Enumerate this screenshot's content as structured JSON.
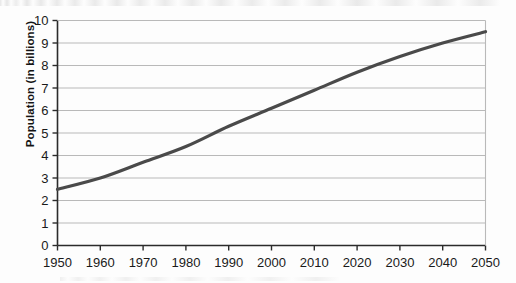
{
  "chart_data": {
    "type": "line",
    "title": "",
    "xlabel": "",
    "ylabel": "Population (in billions)",
    "xlim": [
      1950,
      2050
    ],
    "ylim": [
      0,
      10
    ],
    "grid": true,
    "legend": "none",
    "x": [
      1950,
      1960,
      1970,
      1980,
      1990,
      2000,
      2010,
      2020,
      2030,
      2040,
      2050
    ],
    "values": [
      2.5,
      3.0,
      3.7,
      4.4,
      5.3,
      6.1,
      6.9,
      7.7,
      8.4,
      9.0,
      9.5
    ],
    "series": [
      {
        "name": "World population",
        "values": [
          2.5,
          3.0,
          3.7,
          4.4,
          5.3,
          6.1,
          6.9,
          7.7,
          8.4,
          9.0,
          9.5
        ],
        "color": "#4a4a4a"
      }
    ],
    "xticks": [
      "1950",
      "1960",
      "1970",
      "1980",
      "1990",
      "2000",
      "2010",
      "2020",
      "2030",
      "2040",
      "2050"
    ],
    "yticks": [
      "0",
      "1",
      "2",
      "3",
      "4",
      "5",
      "6",
      "7",
      "8",
      "9",
      "10"
    ]
  },
  "axes": {
    "y_axis_title": "Population (in billions)",
    "y_tick_labels": [
      "10",
      "9",
      "8",
      "7",
      "6",
      "5",
      "4",
      "3",
      "2",
      "1",
      "0"
    ],
    "x_tick_labels": [
      "1950",
      "1960",
      "1970",
      "1980",
      "1990",
      "2000",
      "2010",
      "2020",
      "2030",
      "2040",
      "2050"
    ]
  },
  "colors": {
    "line": "#4a4a4a",
    "grid": "#b9b9b9",
    "axis": "#2b2b2b",
    "background": "#fdfdfd",
    "text": "#1a1a1a"
  }
}
